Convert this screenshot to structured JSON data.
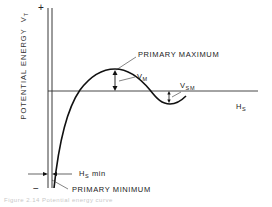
{
  "diagram": {
    "y_axis": {
      "label": "POTENTIAL ENERGY",
      "symbol": "V",
      "symbol_sub": "T",
      "plus_sign": "+",
      "minus_sign": "−"
    },
    "x_axis": {
      "symbol": "H",
      "symbol_sub": "S"
    },
    "annotations": {
      "primary_maximum": "PRIMARY  MAXIMUM",
      "primary_minimum": "PRIMARY  MINIMUM",
      "vm": {
        "symbol": "V",
        "sub": "M"
      },
      "vsm": {
        "symbol": "V",
        "sub": "SM"
      },
      "hs_min": {
        "symbol": "H",
        "sub": "S",
        "suffix": " min"
      }
    },
    "caption": "Figure 2.14   Potential energy curve"
  },
  "colors": {
    "ink": "#1a1a1a",
    "background": "#ffffff",
    "caption": "#c8c8c8"
  }
}
